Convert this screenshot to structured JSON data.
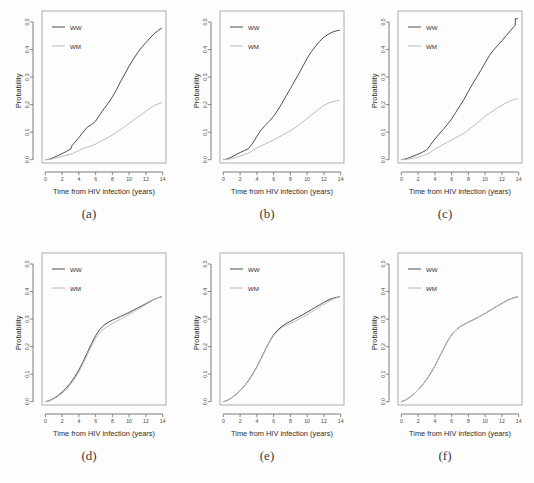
{
  "figure": {
    "background": "#fdfdfd",
    "panel_count": 6
  },
  "axes": {
    "xlabel": "Time from HIV infection (years)",
    "ylabel": "Probability",
    "xticks": [
      "0",
      "2",
      "4",
      "6",
      "8",
      "10",
      "12",
      "14"
    ],
    "xtick_values": [
      0,
      2,
      4,
      6,
      8,
      10,
      12,
      14
    ],
    "yticks": [
      "0.0",
      "0.1",
      "0.2",
      "0.3",
      "0.4",
      "0.5"
    ],
    "ytick_values": [
      0.0,
      0.1,
      0.2,
      0.3,
      0.4,
      0.5
    ],
    "xlim": [
      -0.4,
      14.4
    ],
    "ylim": [
      -0.012,
      0.54
    ],
    "grid": false
  },
  "legend": {
    "position": "top-left",
    "entries": [
      {
        "label": "WW",
        "color": "#4d4d4d",
        "series": "ww"
      },
      {
        "label": "WM",
        "color": "#b8b8b8",
        "series": "wm"
      }
    ]
  },
  "colors": {
    "ww": "#4d4d4d",
    "wm": "#bcbcbc",
    "frame": "#9a9a9a",
    "axis": "#5a5a5a",
    "text": "#2e2e2e",
    "background": "#fdfdfd"
  },
  "captions": [
    "(a)",
    "(b)",
    "(c)",
    "(d)",
    "(e)",
    "(f)"
  ],
  "chart_data": [
    {
      "id": "a",
      "caption": "(a)",
      "type": "line",
      "title": "",
      "xlabel": "Time from HIV infection (years)",
      "ylabel": "Probability",
      "xlim": [
        0,
        14
      ],
      "ylim": [
        0,
        0.5
      ],
      "grid": false,
      "legend_position": "top-left",
      "x": [
        0,
        0.5,
        1,
        1.5,
        2,
        2.5,
        3,
        3.2,
        3.5,
        4,
        4.5,
        5,
        5.5,
        6,
        6.5,
        7,
        7.5,
        8,
        8.5,
        9,
        9.5,
        10,
        10.5,
        11,
        11.5,
        12,
        12.5,
        13,
        13.5,
        13.9
      ],
      "series": [
        {
          "name": "WW",
          "color": "#4d4d4d",
          "values": [
            0.0,
            0.002,
            0.008,
            0.015,
            0.022,
            0.03,
            0.038,
            0.052,
            0.062,
            0.08,
            0.1,
            0.118,
            0.127,
            0.14,
            0.163,
            0.185,
            0.205,
            0.228,
            0.255,
            0.285,
            0.312,
            0.34,
            0.365,
            0.388,
            0.408,
            0.425,
            0.442,
            0.458,
            0.47,
            0.478
          ]
        },
        {
          "name": "WM",
          "color": "#bcbcbc",
          "values": [
            0.0,
            0.001,
            0.004,
            0.008,
            0.012,
            0.016,
            0.02,
            0.022,
            0.026,
            0.033,
            0.04,
            0.046,
            0.05,
            0.057,
            0.065,
            0.073,
            0.081,
            0.09,
            0.1,
            0.11,
            0.12,
            0.132,
            0.143,
            0.154,
            0.165,
            0.176,
            0.188,
            0.197,
            0.203,
            0.207
          ]
        }
      ]
    },
    {
      "id": "b",
      "caption": "(b)",
      "type": "line",
      "title": "",
      "xlabel": "Time from HIV infection (years)",
      "ylabel": "Probability",
      "xlim": [
        0,
        14
      ],
      "ylim": [
        0,
        0.5
      ],
      "grid": false,
      "legend_position": "top-left",
      "x": [
        0,
        0.5,
        1,
        1.5,
        2,
        2.5,
        3,
        3.2,
        3.5,
        4,
        4.5,
        5,
        5.5,
        6,
        6.5,
        7,
        7.5,
        8,
        8.5,
        9,
        9.5,
        10,
        10.5,
        11,
        11.5,
        12,
        12.5,
        13,
        13.5,
        13.9
      ],
      "series": [
        {
          "name": "WW",
          "color": "#4d4d4d",
          "values": [
            0.0,
            0.003,
            0.01,
            0.018,
            0.026,
            0.033,
            0.04,
            0.048,
            0.06,
            0.085,
            0.108,
            0.125,
            0.14,
            0.158,
            0.18,
            0.205,
            0.232,
            0.258,
            0.285,
            0.312,
            0.34,
            0.368,
            0.392,
            0.412,
            0.43,
            0.445,
            0.455,
            0.463,
            0.468,
            0.47
          ]
        },
        {
          "name": "WM",
          "color": "#bcbcbc",
          "values": [
            0.0,
            0.001,
            0.004,
            0.008,
            0.013,
            0.018,
            0.024,
            0.027,
            0.033,
            0.042,
            0.05,
            0.057,
            0.064,
            0.072,
            0.08,
            0.088,
            0.097,
            0.105,
            0.115,
            0.125,
            0.138,
            0.15,
            0.162,
            0.174,
            0.186,
            0.197,
            0.205,
            0.21,
            0.214,
            0.216
          ]
        }
      ]
    },
    {
      "id": "c",
      "caption": "(c)",
      "type": "line",
      "title": "",
      "xlabel": "Time from HIV infection (years)",
      "ylabel": "Probability",
      "xlim": [
        0,
        14
      ],
      "ylim": [
        0,
        0.52
      ],
      "grid": false,
      "legend_position": "top-left",
      "x": [
        0,
        0.5,
        1,
        1.5,
        2,
        2.5,
        3,
        3.2,
        3.5,
        4,
        4.5,
        5,
        5.5,
        6,
        6.5,
        7,
        7.5,
        8,
        8.5,
        9,
        9.5,
        10,
        10.5,
        11,
        11.5,
        12,
        12.5,
        13,
        13.4,
        13.6,
        13.6,
        13.9
      ],
      "series": [
        {
          "name": "WW",
          "color": "#4d4d4d",
          "values": [
            0.0,
            0.003,
            0.008,
            0.014,
            0.02,
            0.027,
            0.035,
            0.042,
            0.055,
            0.075,
            0.093,
            0.11,
            0.128,
            0.148,
            0.172,
            0.196,
            0.22,
            0.248,
            0.275,
            0.3,
            0.325,
            0.352,
            0.378,
            0.398,
            0.415,
            0.432,
            0.45,
            0.468,
            0.482,
            0.488,
            0.512,
            0.512
          ]
        },
        {
          "name": "WM",
          "color": "#bcbcbc",
          "values": [
            0.0,
            0.001,
            0.003,
            0.006,
            0.01,
            0.014,
            0.019,
            0.022,
            0.028,
            0.038,
            0.047,
            0.055,
            0.063,
            0.072,
            0.08,
            0.088,
            0.097,
            0.108,
            0.12,
            0.132,
            0.145,
            0.158,
            0.168,
            0.178,
            0.188,
            0.198,
            0.206,
            0.214,
            0.218,
            0.22,
            0.22,
            0.221
          ]
        }
      ]
    },
    {
      "id": "d",
      "caption": "(d)",
      "type": "line",
      "title": "",
      "xlabel": "Time from HIV infection (years)",
      "ylabel": "Probability",
      "xlim": [
        0,
        14
      ],
      "ylim": [
        0,
        0.4
      ],
      "grid": false,
      "legend_position": "top-left",
      "x": [
        0,
        0.5,
        1,
        1.5,
        2,
        2.5,
        3,
        3.5,
        4,
        4.5,
        5,
        5.5,
        6,
        6.5,
        7,
        7.5,
        8,
        8.5,
        9,
        9.5,
        10,
        10.5,
        11,
        11.5,
        12,
        12.5,
        13,
        13.5,
        13.9
      ],
      "series": [
        {
          "name": "WW",
          "color": "#4d4d4d",
          "values": [
            0.0,
            0.004,
            0.012,
            0.022,
            0.035,
            0.05,
            0.068,
            0.09,
            0.115,
            0.145,
            0.178,
            0.21,
            0.24,
            0.262,
            0.278,
            0.288,
            0.296,
            0.303,
            0.31,
            0.317,
            0.324,
            0.332,
            0.34,
            0.348,
            0.356,
            0.364,
            0.372,
            0.378,
            0.381
          ]
        },
        {
          "name": "WM",
          "color": "#bcbcbc",
          "values": [
            0.0,
            0.003,
            0.01,
            0.019,
            0.031,
            0.045,
            0.062,
            0.083,
            0.108,
            0.138,
            0.17,
            0.202,
            0.23,
            0.25,
            0.265,
            0.275,
            0.284,
            0.292,
            0.3,
            0.308,
            0.317,
            0.326,
            0.335,
            0.344,
            0.353,
            0.362,
            0.371,
            0.378,
            0.382
          ]
        }
      ]
    },
    {
      "id": "e",
      "caption": "(e)",
      "type": "line",
      "title": "",
      "xlabel": "Time from HIV infection (years)",
      "ylabel": "Probability",
      "xlim": [
        0,
        14
      ],
      "ylim": [
        0,
        0.4
      ],
      "grid": false,
      "legend_position": "top-left",
      "x": [
        0,
        0.5,
        1,
        1.5,
        2,
        2.5,
        3,
        3.5,
        4,
        4.5,
        5,
        5.5,
        6,
        6.5,
        7,
        7.5,
        8,
        8.5,
        9,
        9.5,
        10,
        10.5,
        11,
        11.5,
        12,
        12.5,
        13,
        13.5,
        13.9
      ],
      "series": [
        {
          "name": "WW",
          "color": "#4d4d4d",
          "values": [
            0.0,
            0.005,
            0.014,
            0.026,
            0.04,
            0.057,
            0.077,
            0.1,
            0.127,
            0.157,
            0.188,
            0.218,
            0.243,
            0.261,
            0.274,
            0.284,
            0.292,
            0.3,
            0.308,
            0.316,
            0.325,
            0.334,
            0.343,
            0.352,
            0.361,
            0.369,
            0.375,
            0.379,
            0.381
          ]
        },
        {
          "name": "WM",
          "color": "#bcbcbc",
          "values": [
            0.0,
            0.005,
            0.014,
            0.025,
            0.039,
            0.056,
            0.075,
            0.098,
            0.125,
            0.155,
            0.186,
            0.216,
            0.24,
            0.257,
            0.269,
            0.277,
            0.284,
            0.291,
            0.299,
            0.307,
            0.316,
            0.325,
            0.334,
            0.344,
            0.354,
            0.363,
            0.371,
            0.377,
            0.38
          ]
        }
      ]
    },
    {
      "id": "f",
      "caption": "(f)",
      "type": "line",
      "title": "",
      "xlabel": "Time from HIV infection (years)",
      "ylabel": "Probability",
      "xlim": [
        0,
        14
      ],
      "ylim": [
        0,
        0.4
      ],
      "grid": false,
      "legend_position": "top-left",
      "x": [
        0,
        0.5,
        1,
        1.5,
        2,
        2.5,
        3,
        3.5,
        4,
        4.5,
        5,
        5.5,
        6,
        6.5,
        7,
        7.5,
        8,
        8.5,
        9,
        9.5,
        10,
        10.5,
        11,
        11.5,
        12,
        12.5,
        13,
        13.5,
        13.9
      ],
      "series": [
        {
          "name": "WW",
          "color": "#4d4d4d",
          "values": [
            0.0,
            0.006,
            0.016,
            0.028,
            0.043,
            0.06,
            0.08,
            0.103,
            0.13,
            0.16,
            0.19,
            0.219,
            0.243,
            0.26,
            0.272,
            0.281,
            0.289,
            0.296,
            0.304,
            0.312,
            0.321,
            0.33,
            0.339,
            0.348,
            0.357,
            0.366,
            0.373,
            0.378,
            0.381
          ]
        },
        {
          "name": "WM",
          "color": "#bcbcbc",
          "values": [
            0.0,
            0.006,
            0.016,
            0.028,
            0.043,
            0.06,
            0.08,
            0.103,
            0.13,
            0.16,
            0.19,
            0.219,
            0.243,
            0.26,
            0.272,
            0.281,
            0.289,
            0.296,
            0.304,
            0.312,
            0.321,
            0.33,
            0.339,
            0.348,
            0.357,
            0.366,
            0.373,
            0.378,
            0.381
          ]
        }
      ]
    }
  ]
}
